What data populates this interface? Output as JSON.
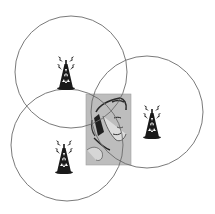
{
  "diagram": {
    "colors": {
      "background": "#ffffff",
      "circle_stroke": "#6b6b6b",
      "tower": "#1a1a1a",
      "person_panel": "#bdbdbd"
    },
    "towers": [
      {
        "id": "tower-1",
        "icon": "radio-tower-icon",
        "cx": 66,
        "cy": 72
      },
      {
        "id": "tower-2",
        "icon": "radio-tower-icon",
        "cx": 152,
        "cy": 115
      },
      {
        "id": "tower-3",
        "icon": "radio-tower-icon",
        "cx": 64,
        "cy": 152
      }
    ],
    "coverage_circles": [
      {
        "id": "coverage-1",
        "cx": 71,
        "cy": 72,
        "r": 56
      },
      {
        "id": "coverage-2",
        "cx": 147,
        "cy": 112,
        "r": 56
      },
      {
        "id": "coverage-3",
        "cx": 67,
        "cy": 145,
        "r": 56
      }
    ],
    "person": {
      "icon": "person-on-phone-icon",
      "x": 86,
      "y": 94,
      "width": 45,
      "height": 71
    }
  }
}
